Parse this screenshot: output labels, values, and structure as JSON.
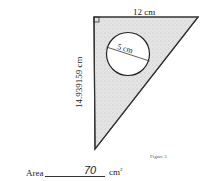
{
  "question": {
    "number": ")"
  },
  "figure": {
    "type": "right-triangle-with-circular-hole",
    "top_side_label": "12 cm",
    "vertical_side_label": "14.939159 cm",
    "circle_diameter_label": "5 cm",
    "caption": "Figure 3",
    "fill_color": "#d9d9d9",
    "stroke_color": "#333333"
  },
  "answer": {
    "label": "Area",
    "value": "70",
    "unit": "cm",
    "unit_power": "2"
  }
}
